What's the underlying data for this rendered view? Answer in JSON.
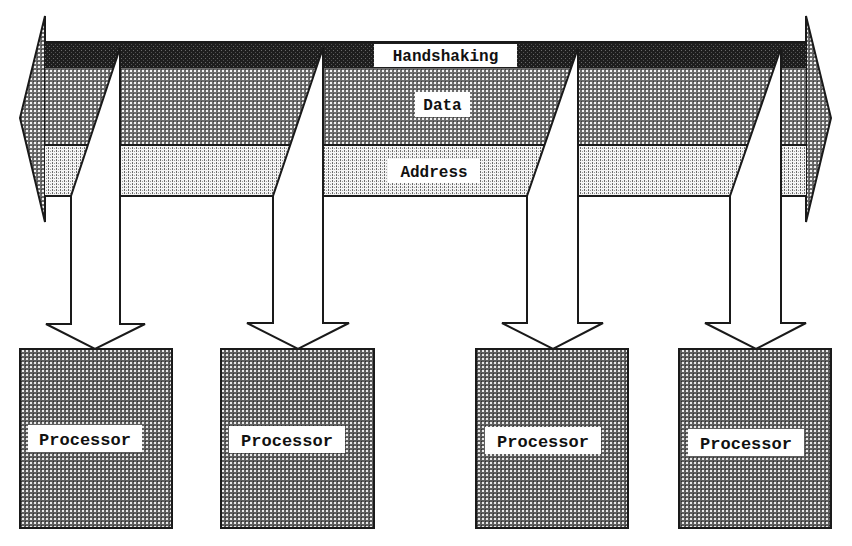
{
  "diagram": {
    "type": "shared-bus multiprocessor architecture",
    "bus": {
      "lines": [
        {
          "id": "handshaking",
          "label": "Handshaking",
          "fill": "#1e1e1e"
        },
        {
          "id": "data",
          "label": "Data",
          "fill": "#8a8a8a"
        },
        {
          "id": "address",
          "label": "Address",
          "fill": "#c8c8c8"
        }
      ],
      "direction": "bidirectional"
    },
    "processors": [
      {
        "label": "Processor"
      },
      {
        "label": "Processor"
      },
      {
        "label": "Processor"
      },
      {
        "label": "Processor"
      }
    ],
    "colors": {
      "outline": "#1a1a1a",
      "background": "#ffffff",
      "label_bg": "#ffffff",
      "processor_fill": "#7a7a7a"
    }
  }
}
